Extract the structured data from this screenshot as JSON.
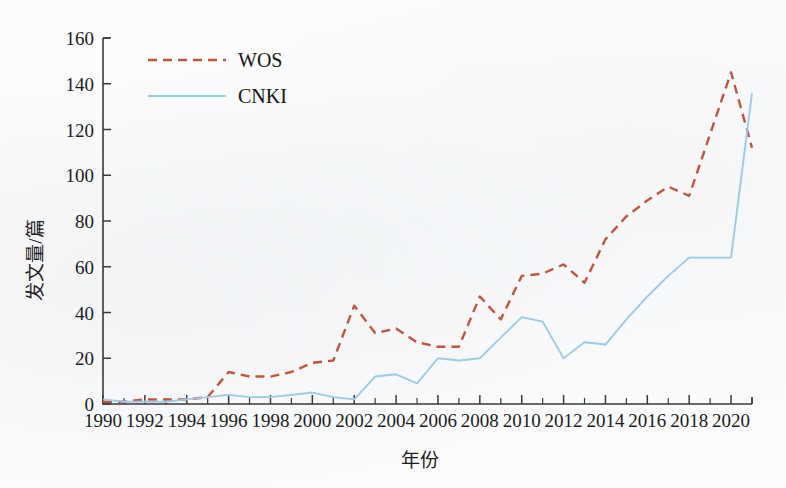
{
  "chart_data": {
    "type": "line",
    "title": "",
    "xlabel": "年份",
    "ylabel": "发文量/篇",
    "xlim": [
      1990,
      2021
    ],
    "ylim": [
      0,
      160
    ],
    "grid": false,
    "legend_position": "top-left-inside",
    "x": [
      1990,
      1991,
      1992,
      1993,
      1994,
      1995,
      1996,
      1997,
      1998,
      1999,
      2000,
      2001,
      2002,
      2003,
      2004,
      2005,
      2006,
      2007,
      2008,
      2009,
      2010,
      2011,
      2012,
      2013,
      2014,
      2015,
      2016,
      2017,
      2018,
      2019,
      2020,
      2021
    ],
    "xticks": [
      1990,
      1992,
      1994,
      1996,
      1998,
      2000,
      2002,
      2004,
      2006,
      2008,
      2010,
      2012,
      2014,
      2016,
      2018,
      2020
    ],
    "xtick_labels": [
      "1990",
      "1992",
      "1994",
      "1996",
      "1998",
      "2000",
      "2002",
      "2004",
      "2006",
      "2008",
      "2010",
      "2012",
      "2014",
      "2016",
      "2018",
      "2020"
    ],
    "yticks": [
      0,
      20,
      40,
      60,
      80,
      100,
      120,
      140,
      160
    ],
    "ytick_labels": [
      "0",
      "20",
      "40",
      "60",
      "80",
      "100",
      "120",
      "140",
      "160"
    ],
    "series": [
      {
        "name": "WOS",
        "color": "#c0553c",
        "style": "dashed",
        "values": [
          1,
          1,
          2,
          2,
          2,
          3,
          14,
          12,
          12,
          14,
          18,
          19,
          43,
          31,
          33,
          27,
          25,
          25,
          47,
          37,
          56,
          57,
          61,
          53,
          72,
          82,
          89,
          95,
          91,
          118,
          145,
          112
        ]
      },
      {
        "name": "CNKI",
        "color": "#9ccbe6",
        "style": "solid",
        "values": [
          2,
          1,
          1,
          1,
          2,
          3,
          4,
          3,
          3,
          4,
          5,
          3,
          2,
          12,
          13,
          9,
          20,
          19,
          20,
          29,
          38,
          36,
          20,
          27,
          26,
          37,
          47,
          56,
          64,
          64,
          64,
          136
        ]
      }
    ]
  },
  "legend": {
    "items": [
      {
        "label": "WOS",
        "color": "#c0553c",
        "style": "dashed"
      },
      {
        "label": "CNKI",
        "color": "#9ccbe6",
        "style": "solid"
      }
    ]
  },
  "axes": {
    "y_title": "发文量/篇",
    "x_title": "年份"
  }
}
